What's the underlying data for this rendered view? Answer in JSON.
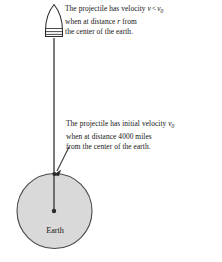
{
  "figure": {
    "background_color": "#ffffff",
    "width": 222,
    "height": 262
  },
  "annotations": {
    "top": {
      "line1_a": "The projectile has velocity ",
      "line1_v": "v",
      "line1_lt": "<",
      "line1_v0": "v",
      "line1_v0_sub": "0",
      "line2_a": "when at distance ",
      "line2_r": "r",
      "line2_b": " from",
      "line3": "the center of the earth."
    },
    "bottom": {
      "line1_a": "The projectile has initial velocity ",
      "line1_v0": "v",
      "line1_v0_sub": "0",
      "line2": "when at distance 4000 miles",
      "line3": "from the center of the earth.",
      "distance_value": "4000",
      "distance_unit": "miles"
    }
  },
  "earth": {
    "label": "Earth",
    "fill_color": "#d9d9d9",
    "stroke_color": "#4a4a4a",
    "center_x": 54.5,
    "center_y": 211,
    "radius": 37.5
  },
  "projectile": {
    "name": "projectile-bullet",
    "fill_color": "#ffffff",
    "stroke_color": "#2b2b2b",
    "tip_y": 4,
    "base_y": 37
  },
  "trajectory": {
    "name": "flight-path-line",
    "stroke_color": "#333333",
    "from_x": 54,
    "from_y": 38,
    "to_x": 54,
    "to_y": 211
  },
  "pointer": {
    "name": "surface-pointer-arrow",
    "stroke_color": "#3a3a3a",
    "from_x": 69,
    "from_y": 147,
    "to_x": 55.5,
    "to_y": 173.5
  },
  "markers": {
    "surface_point_color": "#2a2a2a",
    "center_point_color": "#2a2a2a"
  }
}
